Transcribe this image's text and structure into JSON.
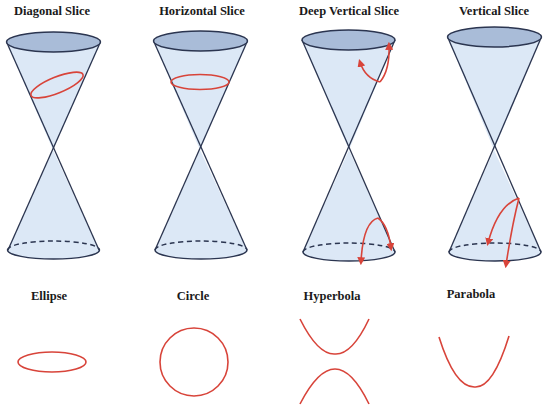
{
  "colors": {
    "cone_fill": "#dce8f6",
    "cone_top_fill": "#a9bcd8",
    "cone_stroke": "#2b3550",
    "slice_red": "#d8443a"
  },
  "slices": [
    {
      "label": "Diagonal Slice",
      "result": "Ellipse"
    },
    {
      "label": "Horizontal Slice",
      "result": "Circle"
    },
    {
      "label": "Deep Vertical Slice",
      "result": "Hyperbola"
    },
    {
      "label": "Vertical Slice",
      "result": "Parabola"
    }
  ]
}
